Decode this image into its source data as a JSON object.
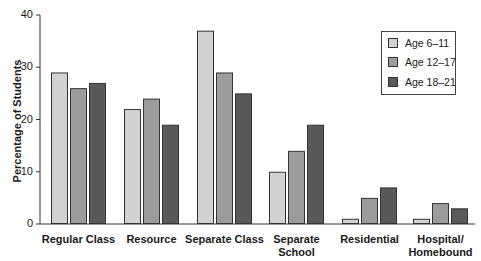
{
  "chart_data": {
    "type": "bar",
    "title": "",
    "xlabel": "",
    "ylabel": "Percentage of Students",
    "ylim": [
      0,
      40
    ],
    "yticks": [
      0,
      10,
      20,
      30,
      40
    ],
    "grid": false,
    "legend_position": "upper right",
    "categories": [
      "Regular Class",
      "Resource",
      "Separate Class",
      "Separate School",
      "Residential",
      "Hospital/ Homebound"
    ],
    "category_lines": [
      [
        "Regular Class"
      ],
      [
        "Resource"
      ],
      [
        "Separate Class"
      ],
      [
        "Separate",
        "School"
      ],
      [
        "Residential"
      ],
      [
        "Hospital/",
        "Homebound"
      ]
    ],
    "series": [
      {
        "name": "Age 6–11",
        "color": "#d2d2d2",
        "values": [
          29,
          22,
          37,
          10,
          1,
          1
        ]
      },
      {
        "name": "Age 12–17",
        "color": "#9c9c9c",
        "values": [
          26,
          24,
          29,
          14,
          5,
          4
        ]
      },
      {
        "name": "Age 18–21",
        "color": "#595959",
        "values": [
          27,
          19,
          25,
          19,
          7,
          3
        ]
      }
    ]
  },
  "axis": {
    "ylabel": "Percentage of Students",
    "tick_labels": [
      "0",
      "10",
      "20",
      "30",
      "40"
    ]
  },
  "legend": {
    "items": [
      {
        "label": "Age 6–11",
        "color": "#d2d2d2"
      },
      {
        "label": "Age 12–17",
        "color": "#9c9c9c"
      },
      {
        "label": "Age 18–21",
        "color": "#595959"
      }
    ]
  }
}
